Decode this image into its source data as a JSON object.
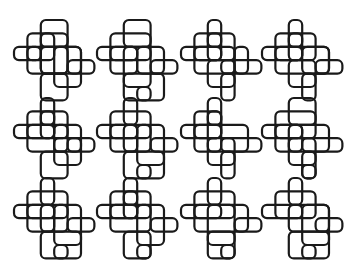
{
  "style": {
    "stroke": "#1a1a1a",
    "stroke_width": 2.2,
    "background": "#ffffff",
    "cell": 13.4,
    "radius": 5
  },
  "grid": {
    "columns": [
      14,
      97,
      181,
      262
    ],
    "rows": [
      20,
      98,
      178
    ]
  },
  "tiles": [
    {
      "id": "r1c1",
      "row": 0,
      "col": 0,
      "rects": [
        [
          2,
          0,
          2,
          2
        ],
        [
          1,
          1,
          2,
          2
        ],
        [
          0,
          2,
          2,
          1
        ],
        [
          2,
          2,
          2,
          2
        ],
        [
          1,
          2,
          4,
          2
        ],
        [
          3,
          2,
          2,
          3
        ],
        [
          2,
          4,
          2,
          2
        ],
        [
          4,
          3,
          2,
          1
        ],
        [
          2,
          1,
          2,
          3
        ]
      ]
    },
    {
      "id": "r1c2",
      "row": 0,
      "col": 1,
      "rects": [
        [
          2,
          0,
          2,
          2
        ],
        [
          1,
          1,
          3,
          2
        ],
        [
          0,
          2,
          3,
          1
        ],
        [
          2,
          2,
          2,
          3
        ],
        [
          3,
          2,
          2,
          2
        ],
        [
          4,
          3,
          2,
          1
        ],
        [
          2,
          4,
          3,
          2
        ],
        [
          1,
          2,
          2,
          2
        ],
        [
          3,
          5,
          1,
          1
        ]
      ]
    },
    {
      "id": "r1c3",
      "row": 0,
      "col": 2,
      "rects": [
        [
          2,
          0,
          1,
          2
        ],
        [
          1,
          1,
          2,
          2
        ],
        [
          0,
          2,
          3,
          1
        ],
        [
          2,
          1,
          2,
          2
        ],
        [
          1,
          2,
          3,
          2
        ],
        [
          3,
          3,
          3,
          1
        ],
        [
          2,
          3,
          2,
          2
        ],
        [
          4,
          2,
          1,
          2
        ],
        [
          3,
          4,
          1,
          2
        ]
      ]
    },
    {
      "id": "r1c4",
      "row": 0,
      "col": 3,
      "rects": [
        [
          2,
          0,
          1,
          2
        ],
        [
          1,
          1,
          2,
          2
        ],
        [
          0,
          2,
          3,
          1
        ],
        [
          2,
          1,
          2,
          2
        ],
        [
          3,
          2,
          2,
          2
        ],
        [
          1,
          2,
          4,
          2
        ],
        [
          4,
          3,
          2,
          1
        ],
        [
          2,
          3,
          2,
          2
        ],
        [
          3,
          4,
          1,
          2
        ]
      ]
    },
    {
      "id": "r2c1",
      "row": 1,
      "col": 0,
      "rects": [
        [
          2,
          0,
          1,
          2
        ],
        [
          1,
          1,
          2,
          2
        ],
        [
          0,
          2,
          3,
          1
        ],
        [
          2,
          1,
          2,
          2
        ],
        [
          1,
          2,
          3,
          2
        ],
        [
          3,
          2,
          2,
          2
        ],
        [
          4,
          3,
          2,
          1
        ],
        [
          3,
          3,
          2,
          2
        ],
        [
          2,
          4,
          2,
          2
        ]
      ]
    },
    {
      "id": "r2c2",
      "row": 1,
      "col": 1,
      "rects": [
        [
          2,
          0,
          1,
          2
        ],
        [
          1,
          1,
          3,
          2
        ],
        [
          0,
          2,
          3,
          1
        ],
        [
          2,
          2,
          2,
          2
        ],
        [
          3,
          2,
          2,
          3
        ],
        [
          4,
          3,
          2,
          1
        ],
        [
          1,
          2,
          2,
          2
        ],
        [
          2,
          4,
          3,
          2
        ],
        [
          3,
          5,
          1,
          1
        ]
      ]
    },
    {
      "id": "r2c3",
      "row": 1,
      "col": 2,
      "rects": [
        [
          2,
          0,
          1,
          2
        ],
        [
          1,
          1,
          2,
          2
        ],
        [
          0,
          2,
          3,
          1
        ],
        [
          2,
          1,
          1,
          3
        ],
        [
          1,
          2,
          4,
          2
        ],
        [
          3,
          3,
          3,
          1
        ],
        [
          2,
          3,
          2,
          2
        ],
        [
          3,
          4,
          1,
          2
        ]
      ]
    },
    {
      "id": "r2c4",
      "row": 1,
      "col": 3,
      "rects": [
        [
          2,
          0,
          2,
          2
        ],
        [
          1,
          1,
          3,
          2
        ],
        [
          0,
          2,
          3,
          1
        ],
        [
          2,
          2,
          3,
          2
        ],
        [
          1,
          2,
          2,
          2
        ],
        [
          3,
          3,
          3,
          1
        ],
        [
          2,
          3,
          2,
          2
        ],
        [
          3,
          5,
          1,
          1
        ],
        [
          3,
          4,
          1,
          2
        ]
      ]
    },
    {
      "id": "r3c1",
      "row": 2,
      "col": 0,
      "rects": [
        [
          2,
          0,
          1,
          2
        ],
        [
          1,
          1,
          3,
          2
        ],
        [
          0,
          2,
          3,
          1
        ],
        [
          2,
          2,
          2,
          2
        ],
        [
          3,
          2,
          2,
          3
        ],
        [
          4,
          3,
          2,
          1
        ],
        [
          1,
          2,
          2,
          2
        ],
        [
          2,
          4,
          3,
          2
        ],
        [
          3,
          5,
          1,
          1
        ]
      ]
    },
    {
      "id": "r3c2",
      "row": 2,
      "col": 1,
      "rects": [
        [
          2,
          0,
          1,
          2
        ],
        [
          1,
          1,
          2,
          2
        ],
        [
          0,
          2,
          3,
          1
        ],
        [
          2,
          1,
          2,
          2
        ],
        [
          1,
          2,
          3,
          2
        ],
        [
          3,
          2,
          2,
          3
        ],
        [
          4,
          3,
          2,
          1
        ],
        [
          2,
          4,
          2,
          2
        ],
        [
          3,
          5,
          1,
          1
        ]
      ]
    },
    {
      "id": "r3c3",
      "row": 2,
      "col": 2,
      "rects": [
        [
          2,
          0,
          1,
          2
        ],
        [
          1,
          1,
          3,
          2
        ],
        [
          0,
          2,
          3,
          1
        ],
        [
          2,
          2,
          2,
          3
        ],
        [
          1,
          2,
          4,
          2
        ],
        [
          4,
          3,
          2,
          1
        ],
        [
          2,
          4,
          2,
          2
        ],
        [
          3,
          5,
          1,
          1
        ]
      ]
    },
    {
      "id": "r3c4",
      "row": 2,
      "col": 3,
      "rects": [
        [
          2,
          0,
          1,
          2
        ],
        [
          1,
          1,
          3,
          2
        ],
        [
          0,
          2,
          3,
          1
        ],
        [
          2,
          2,
          3,
          2
        ],
        [
          3,
          2,
          2,
          3
        ],
        [
          4,
          3,
          2,
          1
        ],
        [
          2,
          4,
          3,
          2
        ],
        [
          3,
          5,
          1,
          1
        ]
      ]
    }
  ]
}
